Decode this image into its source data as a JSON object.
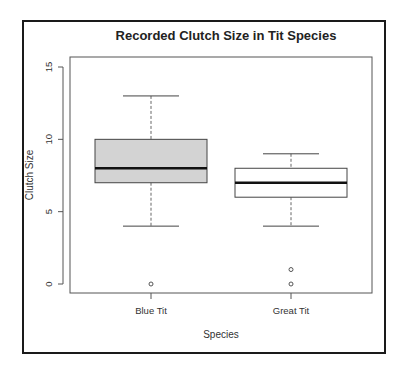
{
  "chart_data": {
    "type": "boxplot",
    "title": "Recorded Clutch Size in Tit Species",
    "xlabel": "Species",
    "ylabel": "Clutch Size",
    "ylim": [
      -0.6,
      15.6
    ],
    "yticks": [
      0,
      5,
      10,
      15
    ],
    "ytick_labels": [
      "0",
      "5",
      "10",
      "15"
    ],
    "categories": [
      "Blue Tit",
      "Great Tit"
    ],
    "grid": false,
    "boxes": [
      {
        "name": "Blue Tit",
        "whisker_low": 4,
        "q1": 7,
        "median": 8,
        "q3": 10,
        "whisker_high": 13,
        "outliers": [
          0
        ],
        "fill": "#d3d3d3"
      },
      {
        "name": "Great Tit",
        "whisker_low": 4,
        "q1": 6,
        "median": 7,
        "q3": 8,
        "whisker_high": 9,
        "outliers": [
          0,
          1
        ],
        "fill": "#ffffff"
      }
    ]
  }
}
